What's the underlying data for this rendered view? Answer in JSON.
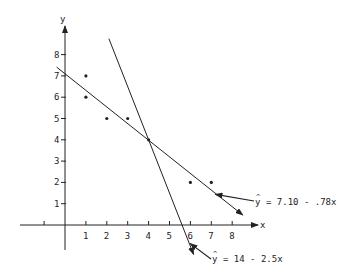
{
  "chart_data": {
    "type": "scatter",
    "title": "",
    "xlabel": "x",
    "ylabel": "y",
    "x_ticks": [
      1,
      2,
      3,
      4,
      5,
      6,
      7,
      8
    ],
    "y_ticks": [
      1,
      2,
      3,
      4,
      5,
      6,
      7,
      8
    ],
    "xlim": [
      -2,
      9
    ],
    "ylim": [
      -1.5,
      9
    ],
    "grid": false,
    "points": [
      {
        "x": 1,
        "y": 7
      },
      {
        "x": 1,
        "y": 6
      },
      {
        "x": 2,
        "y": 5
      },
      {
        "x": 3,
        "y": 5
      },
      {
        "x": 4,
        "y": 4
      },
      {
        "x": 6,
        "y": 2
      },
      {
        "x": 7,
        "y": 2
      }
    ],
    "lines": [
      {
        "name": "least-squares-line",
        "label": "ŷ = 7.10 - .78x",
        "intercept": 7.1,
        "slope": -0.78,
        "x_range": [
          -0.4,
          8.5
        ]
      },
      {
        "name": "alternative-line",
        "label": "ŷ = 14 - 2.5x",
        "intercept": 14,
        "slope": -2.5,
        "x_range": [
          2.1,
          6.15
        ]
      }
    ],
    "annotations": [
      {
        "text": "ŷ = 7.10 - .78x",
        "points_to": "least-squares-line"
      },
      {
        "text": "ŷ = 14 - 2.5x",
        "points_to": "alternative-line"
      }
    ]
  },
  "labels": {
    "x_axis": "x",
    "y_axis": "y",
    "line1_eq": "= 7.10 - .78x",
    "line2_eq": "= 14 - 2.5x",
    "yhat": "y"
  },
  "colors": {
    "ink": "#222222",
    "background": "#ffffff"
  }
}
